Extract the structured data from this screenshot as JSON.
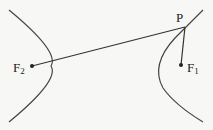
{
  "diagram": {
    "type": "hyperbola-focal-distances",
    "labels": {
      "point": "P",
      "focus1": "F",
      "focus1_sub": "1",
      "focus2": "F",
      "focus2_sub": "2"
    },
    "colors": {
      "stroke": "#333333",
      "background": "#f7f7f5"
    }
  }
}
